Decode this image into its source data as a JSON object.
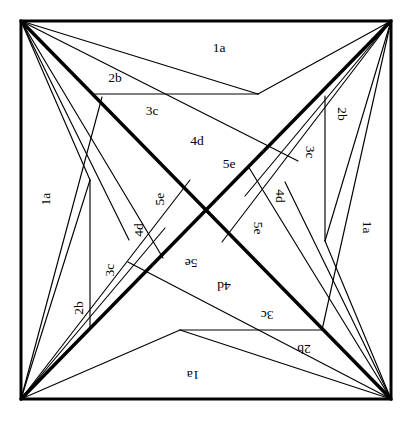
{
  "figure": {
    "type": "geometric-line-diagram",
    "width": 410,
    "height": 421,
    "background_color": "#ffffff",
    "stroke_color": "#000000",
    "symmetry": "4-fold rotational (90 degrees)",
    "frame": {
      "name": "outer-square-border",
      "x": 21,
      "y": 21,
      "width": 370,
      "height": 378,
      "stroke_width": 3
    },
    "corners": {
      "top_left": [
        21,
        21
      ],
      "top_right": [
        391,
        21
      ],
      "bottom_right": [
        391,
        399
      ],
      "bottom_left": [
        21,
        399
      ]
    },
    "center": [
      206,
      210
    ],
    "label_series": [
      "1a",
      "2b",
      "3c",
      "4d",
      "5e"
    ],
    "labels": [
      {
        "text": "1a",
        "x": 219,
        "y": 49,
        "rotate": 0
      },
      {
        "text": "2b",
        "x": 115,
        "y": 79,
        "rotate": 0
      },
      {
        "text": "3c",
        "x": 152,
        "y": 112,
        "rotate": 0
      },
      {
        "text": "4d",
        "x": 197,
        "y": 142,
        "rotate": 0
      },
      {
        "text": "5e",
        "x": 229,
        "y": 165,
        "rotate": 0
      },
      {
        "text": "1a",
        "x": 366,
        "y": 227,
        "rotate": 90
      },
      {
        "text": "2b",
        "x": 341,
        "y": 114,
        "rotate": 90
      },
      {
        "text": "3c",
        "x": 309,
        "y": 152,
        "rotate": 90
      },
      {
        "text": "4d",
        "x": 279,
        "y": 196,
        "rotate": 90
      },
      {
        "text": "5e",
        "x": 257,
        "y": 228,
        "rotate": 90
      },
      {
        "text": "1a",
        "x": 193,
        "y": 374,
        "rotate": 180
      },
      {
        "text": "2b",
        "x": 304,
        "y": 348,
        "rotate": 180
      },
      {
        "text": "3c",
        "x": 267,
        "y": 314,
        "rotate": 180
      },
      {
        "text": "4d",
        "x": 224,
        "y": 285,
        "rotate": 180
      },
      {
        "text": "5e",
        "x": 191,
        "y": 262,
        "rotate": 180
      },
      {
        "text": "1a",
        "x": 47,
        "y": 199,
        "rotate": 270
      },
      {
        "text": "2b",
        "x": 80,
        "y": 308,
        "rotate": 270
      },
      {
        "text": "3c",
        "x": 111,
        "y": 270,
        "rotate": 270
      },
      {
        "text": "4d",
        "x": 140,
        "y": 230,
        "rotate": 270
      },
      {
        "text": "5e",
        "x": 161,
        "y": 199,
        "rotate": 270
      }
    ],
    "diagonals": [
      {
        "name": "spine-tl-br",
        "from": [
          21,
          21
        ],
        "to": [
          391,
          399
        ]
      },
      {
        "name": "spine-tr-bl",
        "from": [
          391,
          21
        ],
        "to": [
          21,
          399
        ]
      }
    ],
    "straight_segments": [
      {
        "name": "top-chord-2b",
        "from": [
          92,
          94
        ],
        "to": [
          258,
          94
        ]
      },
      {
        "name": "right-chord-2b",
        "from": [
          325,
          96
        ],
        "to": [
          325,
          241
        ]
      },
      {
        "name": "bottom-chord-2b",
        "from": [
          322,
          330
        ],
        "to": [
          180,
          330
        ]
      },
      {
        "name": "left-chord-2b",
        "from": [
          90,
          180
        ],
        "to": [
          90,
          328
        ]
      }
    ],
    "ray_count_per_corner": 5
  }
}
